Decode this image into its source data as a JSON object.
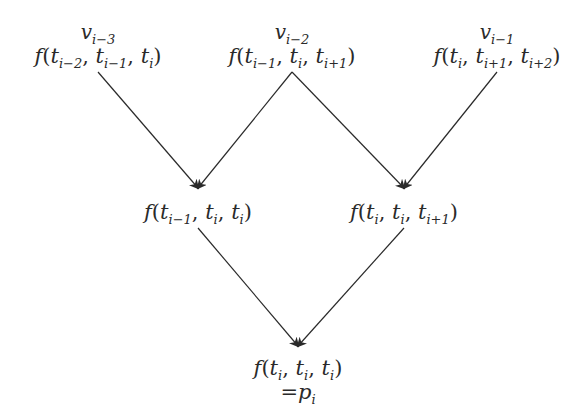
{
  "diagram": {
    "type": "tree-evaluation",
    "nodes": [
      {
        "id": "top-left",
        "var": "v",
        "var_sub": "i−3",
        "fn": "f",
        "args": [
          [
            "t",
            "i−2"
          ],
          [
            "t",
            "i−1"
          ],
          [
            "t",
            "i"
          ]
        ]
      },
      {
        "id": "top-center",
        "var": "v",
        "var_sub": "i−2",
        "fn": "f",
        "args": [
          [
            "t",
            "i−1"
          ],
          [
            "t",
            "i"
          ],
          [
            "t",
            "i+1"
          ]
        ]
      },
      {
        "id": "top-right",
        "var": "v",
        "var_sub": "i−1",
        "fn": "f",
        "args": [
          [
            "t",
            "i"
          ],
          [
            "t",
            "i+1"
          ],
          [
            "t",
            "i+2"
          ]
        ]
      },
      {
        "id": "mid-left",
        "fn": "f",
        "args": [
          [
            "t",
            "i−1"
          ],
          [
            "t",
            "i"
          ],
          [
            "t",
            "i"
          ]
        ]
      },
      {
        "id": "mid-right",
        "fn": "f",
        "args": [
          [
            "t",
            "i"
          ],
          [
            "t",
            "i"
          ],
          [
            "t",
            "i+1"
          ]
        ]
      },
      {
        "id": "bottom",
        "fn": "f",
        "args": [
          [
            "t",
            "i"
          ],
          [
            "t",
            "i"
          ],
          [
            "t",
            "i"
          ]
        ],
        "result": "= p",
        "result_sub": "i"
      }
    ],
    "edges": [
      {
        "from": "top-left",
        "to": "mid-left"
      },
      {
        "from": "top-center",
        "to": "mid-left"
      },
      {
        "from": "top-center",
        "to": "mid-right"
      },
      {
        "from": "top-right",
        "to": "mid-right"
      },
      {
        "from": "mid-left",
        "to": "bottom"
      },
      {
        "from": "mid-right",
        "to": "bottom"
      }
    ],
    "colors": {
      "line": "#2a2a2a",
      "text": "#2a2a2a"
    }
  },
  "labels": {
    "tl_var": "v",
    "tl_var_sub": "i−3",
    "tc_var": "v",
    "tc_var_sub": "i−2",
    "tr_var": "v",
    "tr_var_sub": "i−1",
    "f": "f",
    "t": "t",
    "open": "(",
    "close": ")",
    "comma": ", ",
    "sub_im3": "i−3",
    "sub_im2": "i−2",
    "sub_im1": "i−1",
    "sub_i": "i",
    "sub_ip1": "i+1",
    "sub_ip2": "i+2",
    "eq": "=",
    "p": "p"
  }
}
